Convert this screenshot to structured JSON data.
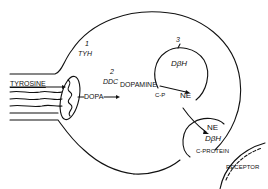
{
  "diagram": {
    "type": "neuron-catecholamine-synthesis",
    "axon_label": "TYROSINE",
    "steps": [
      {
        "number": "1",
        "enzyme": "TYH",
        "product": "DOPA"
      },
      {
        "number": "2",
        "enzyme": "DDC",
        "product": "DOPAMINE"
      },
      {
        "number": "3",
        "enzyme": "DβH",
        "product": "NE"
      }
    ],
    "vesicle_top": {
      "enzyme": "DβH",
      "product": "NE",
      "note": "C-P"
    },
    "vesicle_bottom": {
      "product": "NE",
      "enzyme": "DβH",
      "note": "C-PROTEIN"
    },
    "receptor_label": "RECEPTOR",
    "colors": {
      "ink": "#111111",
      "background": "#ffffff"
    }
  }
}
